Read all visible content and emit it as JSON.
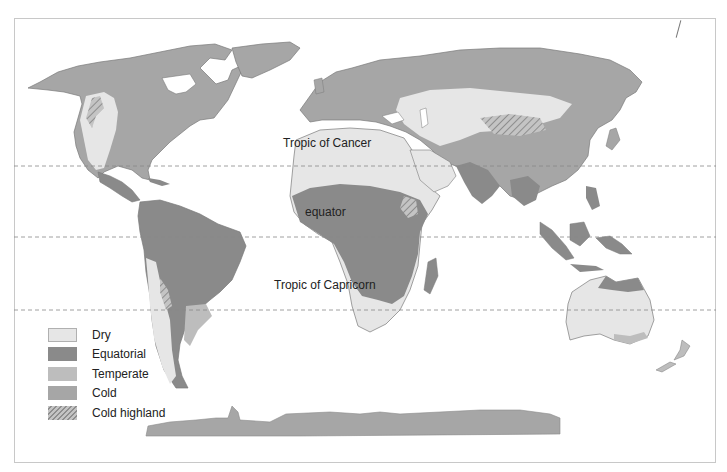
{
  "map": {
    "title": "World climate zones",
    "lines": [
      {
        "name": "Tropic of Cancer",
        "label": "Tropic of Cancer",
        "y": 166
      },
      {
        "name": "equator",
        "label": "equator",
        "y": 237
      },
      {
        "name": "Tropic of Capricorn",
        "label": "Tropic of Capricorn",
        "y": 310
      }
    ],
    "colors": {
      "dry": "#e6e6e6",
      "equatorial": "#8a8a8a",
      "temperate": "#bdbdbd",
      "cold": "#a6a6a6",
      "cold_highland": "hatched",
      "ocean": "#ffffff",
      "border": "#7a7a7a"
    }
  },
  "legend": {
    "items": [
      {
        "label": "Dry",
        "color": "#e6e6e6"
      },
      {
        "label": "Equatorial",
        "color": "#8a8a8a"
      },
      {
        "label": "Temperate",
        "color": "#bdbdbd"
      },
      {
        "label": "Cold",
        "color": "#a6a6a6"
      },
      {
        "label": "Cold highland",
        "color": "hatched"
      }
    ]
  }
}
